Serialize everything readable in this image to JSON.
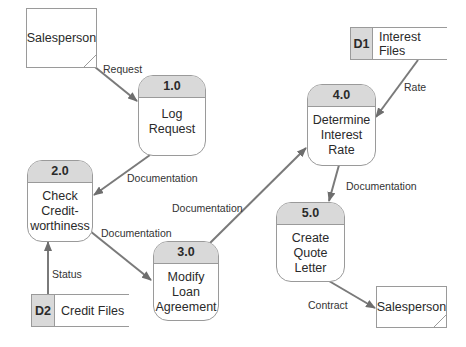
{
  "diagram": {
    "type": "data-flow-diagram",
    "external_entities": [
      {
        "id": "ext-salesperson-source",
        "label": "Salesperson"
      },
      {
        "id": "ext-salesperson-sink",
        "label": "Salesperson"
      }
    ],
    "processes": [
      {
        "number": "1.0",
        "line1": "Log",
        "line2": "Request",
        "line3": ""
      },
      {
        "number": "2.0",
        "line1": "Check",
        "line2": "Credit-",
        "line3": "worthiness"
      },
      {
        "number": "3.0",
        "line1": "Modify",
        "line2": "Loan",
        "line3": "Agreement"
      },
      {
        "number": "4.0",
        "line1": "Determine",
        "line2": "Interest",
        "line3": "Rate"
      },
      {
        "number": "5.0",
        "line1": "Create",
        "line2": "Quote",
        "line3": "Letter"
      }
    ],
    "data_stores": [
      {
        "id": "D1",
        "label": "Interest Files"
      },
      {
        "id": "D2",
        "label": "Credit Files"
      }
    ],
    "flows": [
      {
        "from": "Salesperson",
        "to": "1.0",
        "label": "Request"
      },
      {
        "from": "1.0",
        "to": "2.0",
        "label": "Documentation"
      },
      {
        "from": "2.0",
        "to": "3.0",
        "label": "Documentation"
      },
      {
        "from": "D2",
        "to": "2.0",
        "label": "Status"
      },
      {
        "from": "3.0",
        "to": "4.0",
        "label": "Documentation"
      },
      {
        "from": "D1",
        "to": "4.0",
        "label": "Rate"
      },
      {
        "from": "4.0",
        "to": "5.0",
        "label": "Documentation"
      },
      {
        "from": "5.0",
        "to": "Salesperson",
        "label": "Contract"
      }
    ]
  }
}
